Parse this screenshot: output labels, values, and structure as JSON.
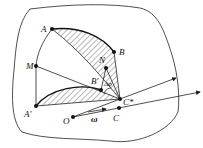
{
  "diagram": {
    "type": "rigid-body-planar-motion",
    "points": {
      "A": "A",
      "B": "B",
      "M": "M",
      "N": "N",
      "B_prime": "B'",
      "A_prime": "A'",
      "C_star": "C*",
      "C": "C",
      "O": "O"
    },
    "annotations": {
      "delta_phi": "Δφ",
      "omega": "ω"
    },
    "colors": {
      "line": "#222222",
      "hatch": "#333333",
      "background": "#ffffff"
    }
  }
}
